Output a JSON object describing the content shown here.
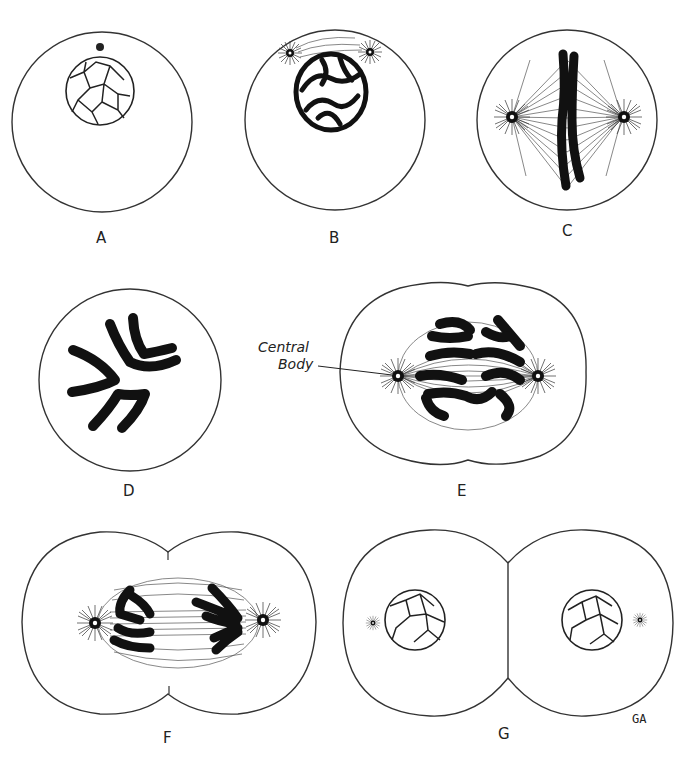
{
  "figure": {
    "panels": [
      {
        "id": "A",
        "label": "A"
      },
      {
        "id": "B",
        "label": "B"
      },
      {
        "id": "C",
        "label": "C"
      },
      {
        "id": "D",
        "label": "D"
      },
      {
        "id": "E",
        "label": "E"
      },
      {
        "id": "F",
        "label": "F"
      },
      {
        "id": "G",
        "label": "G"
      }
    ],
    "annotation": {
      "line1": "Central",
      "line2": "Body"
    },
    "signature": "GA"
  }
}
